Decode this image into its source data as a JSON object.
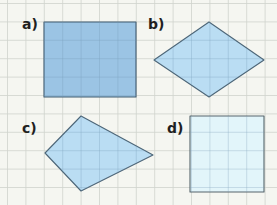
{
  "figure": {
    "background": "#f5f6f1",
    "grid": {
      "color": "#cfd3cd",
      "spacing": 18.4,
      "offset_x": 7.5,
      "offset_y": 3.5
    },
    "shapes": [
      {
        "id": "a",
        "label": "a)",
        "kind": "rectangle",
        "fill": "#92bfe3",
        "stroke": "#3f5a6e",
        "label_pos": [
          22,
          19
        ],
        "points": [
          [
            44,
            22
          ],
          [
            136,
            22
          ],
          [
            136,
            97
          ],
          [
            44,
            97
          ]
        ]
      },
      {
        "id": "b",
        "label": "b)",
        "kind": "rhombus",
        "fill": "#b4daf3",
        "stroke": "#4d6678",
        "label_pos": [
          148,
          19
        ],
        "points": [
          [
            154,
            60
          ],
          [
            209,
            22
          ],
          [
            264,
            60
          ],
          [
            209,
            97
          ]
        ]
      },
      {
        "id": "c",
        "label": "c)",
        "kind": "kite",
        "fill": "#b4daf3",
        "stroke": "#4d6678",
        "label_pos": [
          22,
          123
        ],
        "points": [
          [
            81,
            116
          ],
          [
            153,
            155
          ],
          [
            81,
            191
          ],
          [
            45,
            153
          ]
        ]
      },
      {
        "id": "d",
        "label": "d)",
        "kind": "square",
        "fill": "#dff4fb",
        "stroke": "#56656c",
        "label_pos": [
          167,
          123
        ],
        "points": [
          [
            190,
            116
          ],
          [
            264,
            116
          ],
          [
            264,
            192
          ],
          [
            190,
            192
          ]
        ]
      }
    ]
  }
}
